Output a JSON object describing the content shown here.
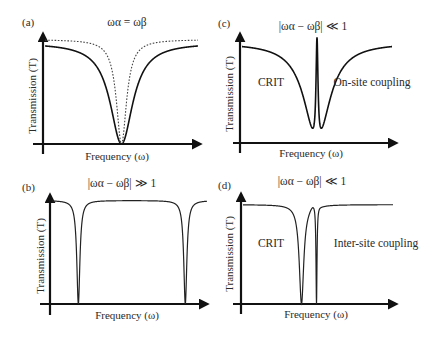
{
  "figure": {
    "panels": [
      {
        "id": "a",
        "label": "(a)",
        "title": "ωα = ωβ",
        "xlabel": "Frequency (ω)",
        "ylabel": "Transmission (T)",
        "annotations": []
      },
      {
        "id": "b",
        "label": "(b)",
        "title": "|ωα − ωβ| ≫ 1",
        "xlabel": "Frequency (ω)",
        "ylabel": "Transmission (T)",
        "annotations": []
      },
      {
        "id": "c",
        "label": "(c)",
        "title": "|ωα − ωβ| ≪ 1",
        "xlabel": "Frequency (ω)",
        "ylabel": "Transmission (T)",
        "annotations": [
          "CRIT",
          "On-site coupling"
        ]
      },
      {
        "id": "d",
        "label": "(d)",
        "title": "|ωα − ωβ| ≪ 1",
        "xlabel": "Frequency (ω)",
        "ylabel": "Transmission (T)",
        "annotations": [
          "CRIT",
          "Inter-site coupling"
        ]
      }
    ]
  },
  "chart_data": [
    {
      "panel": "(a)",
      "type": "line",
      "title": "ωα = ωβ",
      "xlabel": "Frequency (ω)",
      "ylabel": "Transmission (T)",
      "xlim": [
        0,
        1
      ],
      "ylim": [
        0,
        1
      ],
      "grid": false,
      "ticks": false,
      "series": [
        {
          "name": "broad Lorentzian dip (solid)",
          "style": "solid",
          "shape": "lorentzian",
          "center": 0.5,
          "width": 0.09,
          "baseline": 0.92,
          "min": 0.0
        },
        {
          "name": "narrow Lorentzian dip (dotted)",
          "style": "dotted",
          "shape": "lorentzian",
          "center": 0.5,
          "width": 0.04,
          "baseline": 0.95,
          "min": 0.0
        }
      ]
    },
    {
      "panel": "(b)",
      "type": "line",
      "title": "|ωα − ωβ| ≫ 1",
      "xlabel": "Frequency (ω)",
      "ylabel": "Transmission (T)",
      "xlim": [
        0,
        1
      ],
      "ylim": [
        0,
        1
      ],
      "grid": false,
      "ticks": false,
      "series": [
        {
          "name": "two well-separated narrow dips",
          "style": "solid",
          "shape": "double-lorentzian",
          "centers": [
            0.17,
            0.86
          ],
          "width": 0.012,
          "baseline": 0.95,
          "min": 0.0
        }
      ]
    },
    {
      "panel": "(c)",
      "type": "line",
      "title": "|ωα − ωβ| ≪ 1",
      "xlabel": "Frequency (ω)",
      "ylabel": "Transmission (T)",
      "xlim": [
        0,
        1
      ],
      "ylim": [
        0,
        1
      ],
      "grid": false,
      "ticks": false,
      "annotations": [
        {
          "text": "CRIT",
          "x": 0.2,
          "y": 0.55
        },
        {
          "text": "On-site coupling",
          "x": 0.8,
          "y": 0.55
        }
      ],
      "series": [
        {
          "name": "broad dip with sharp transparency peak at center",
          "style": "solid",
          "shape": "CRIT-onsite",
          "center": 0.5,
          "broad_width": 0.1,
          "peak_width": 0.008,
          "baseline": 0.92,
          "peak_height": 0.97,
          "min": 0.0
        }
      ]
    },
    {
      "panel": "(d)",
      "type": "line",
      "title": "|ωα − ωβ| ≪ 1",
      "xlabel": "Frequency (ω)",
      "ylabel": "Transmission (T)",
      "xlim": [
        0,
        1
      ],
      "ylim": [
        0,
        1
      ],
      "grid": false,
      "ticks": false,
      "annotations": [
        {
          "text": "CRIT",
          "x": 0.2,
          "y": 0.55
        },
        {
          "text": "Inter-site coupling",
          "x": 0.8,
          "y": 0.55
        }
      ],
      "series": [
        {
          "name": "asymmetric Fano-like double dip",
          "style": "solid",
          "shape": "CRIT-intersite",
          "centers": [
            0.39,
            0.49
          ],
          "widths": [
            0.018,
            0.004
          ],
          "baseline": 0.92,
          "peak_height": 0.97,
          "min": 0.0
        }
      ]
    }
  ]
}
